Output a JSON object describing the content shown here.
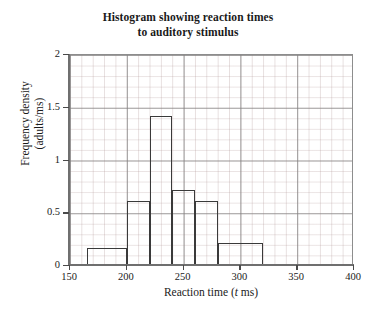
{
  "chart_data": {
    "type": "bar",
    "title": "Histogram showing reaction times to auditory stimulus",
    "title_line1": "Histogram showing reaction times",
    "title_line2": "to auditory stimulus",
    "xlabel": "Reaction time (t ms)",
    "xlabel_prefix": "Reaction time (",
    "xlabel_italic": "t",
    "xlabel_suffix": " ms)",
    "ylabel": "Frequency density (adults/ms)",
    "ylabel_line1": "Frequency density",
    "ylabel_line2": "(adults/ms)",
    "xlim": [
      150,
      400
    ],
    "ylim": [
      0,
      2
    ],
    "xticks": [
      150,
      200,
      250,
      300,
      350,
      400
    ],
    "yticks": [
      "0",
      "0.5",
      "1",
      "1.5",
      "2"
    ],
    "ytick_values": [
      0,
      0.5,
      1,
      1.5,
      2
    ],
    "grid": true,
    "grid_minor_x": 10,
    "grid_minor_y": 0.1,
    "legend": "none",
    "bars": [
      {
        "x_start": 165,
        "x_end": 200,
        "height": 0.15
      },
      {
        "x_start": 200,
        "x_end": 220,
        "height": 0.6
      },
      {
        "x_start": 220,
        "x_end": 240,
        "height": 1.4
      },
      {
        "x_start": 240,
        "x_end": 260,
        "height": 0.7
      },
      {
        "x_start": 260,
        "x_end": 280,
        "height": 0.6
      },
      {
        "x_start": 280,
        "x_end": 320,
        "height": 0.2
      }
    ],
    "colors": {
      "bar_outline": "#3a3a3a",
      "bar_fill": "#ffffff",
      "grid_major": "#828282",
      "grid_minor": "#b09696",
      "axis": "#6f6f6f",
      "text": "#1a1a1a",
      "background": "#ffffff"
    }
  }
}
